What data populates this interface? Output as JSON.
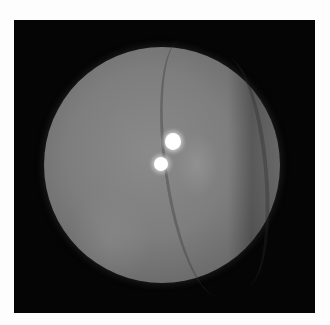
{
  "image": {
    "description": "Grayscale circular fundus photograph on black background",
    "background_color": "#050505",
    "fundus_color": "#7e7e7e",
    "bright_spots": [
      {
        "label": "reflex-spot-upper",
        "cx": 173,
        "cy": 141,
        "r": 8
      },
      {
        "label": "reflex-spot-lower",
        "cx": 161,
        "cy": 164,
        "r": 7
      }
    ]
  }
}
